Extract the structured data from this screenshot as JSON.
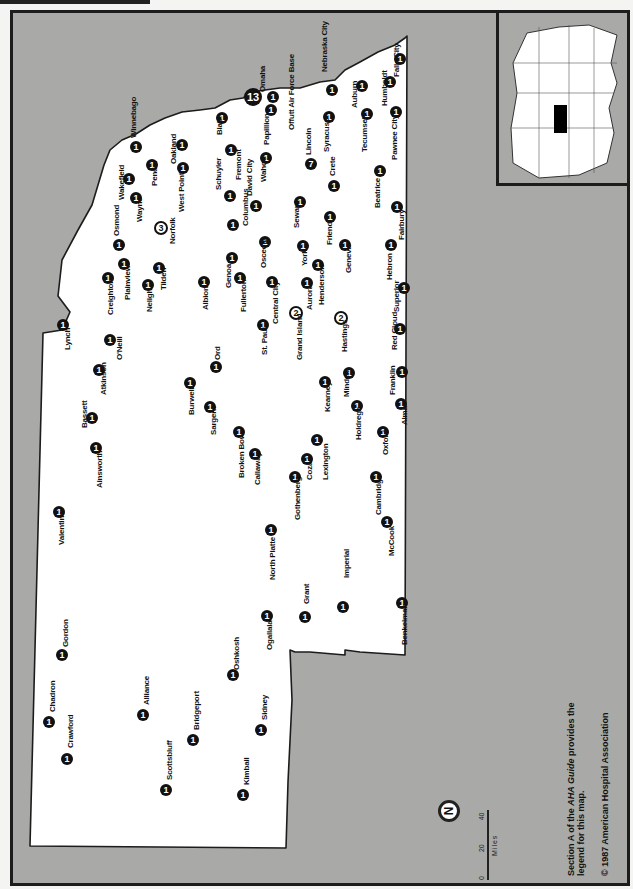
{
  "map": {
    "title": "Nebraska hospitals",
    "colors": {
      "background": "#a9a9a7",
      "state": "#ffffff",
      "marker": "#111111",
      "border": "#1c1c1c"
    },
    "scale": {
      "ticks": [
        "0",
        "20",
        "40"
      ],
      "unit": "Miles"
    },
    "compass": {
      "label": "N"
    },
    "note_line1_pre": "Section A of the ",
    "note_line1_em": "AHA Guide",
    "note_line1_post": " provides the",
    "note_line2": "legend for this map.",
    "copyright": "© 1987 American Hospital Association",
    "inset": {
      "label": "US locator map",
      "highlighted": "Nebraska"
    },
    "cities": [
      {
        "name": "Omaha",
        "count": "13",
        "x": 253,
        "y": 97,
        "lx": 263,
        "ly": 92,
        "big": true
      },
      {
        "name": "Offutt Air Force Base",
        "count": "1",
        "x": 273,
        "y": 97,
        "lx": 292,
        "ly": 130
      },
      {
        "name": "Papillion",
        "count": "1",
        "x": 271,
        "y": 110,
        "lx": 267,
        "ly": 145
      },
      {
        "name": "Nebraska City",
        "count": "1",
        "x": 332,
        "y": 90,
        "lx": 325,
        "ly": 72
      },
      {
        "name": "Falls City",
        "count": "1",
        "x": 400,
        "y": 59,
        "lx": 397,
        "ly": 77
      },
      {
        "name": "Humboldt",
        "count": "1",
        "x": 390,
        "y": 82,
        "lx": 385,
        "ly": 106
      },
      {
        "name": "Auburn",
        "count": "1",
        "x": 362,
        "y": 86,
        "lx": 355,
        "ly": 108
      },
      {
        "name": "Pawnee City",
        "count": "1",
        "x": 396,
        "y": 112,
        "lx": 395,
        "ly": 160
      },
      {
        "name": "Tecumseh",
        "count": "1",
        "x": 367,
        "y": 114,
        "lx": 365,
        "ly": 152
      },
      {
        "name": "Syracuse",
        "count": "1",
        "x": 329,
        "y": 117,
        "lx": 327,
        "ly": 152
      },
      {
        "name": "Lincoln",
        "count": "7",
        "x": 311,
        "y": 164,
        "lx": 309,
        "ly": 155,
        "outline": false
      },
      {
        "name": "Crete",
        "count": "1",
        "x": 334,
        "y": 186,
        "lx": 333,
        "ly": 176
      },
      {
        "name": "Beatrice",
        "count": "1",
        "x": 380,
        "y": 171,
        "lx": 378,
        "ly": 208
      },
      {
        "name": "Fairbury",
        "count": "1",
        "x": 397,
        "y": 207,
        "lx": 402,
        "ly": 240
      },
      {
        "name": "Wahoo",
        "count": "1",
        "x": 266,
        "y": 158,
        "lx": 264,
        "ly": 182
      },
      {
        "name": "Fremont",
        "count": "1",
        "x": 231,
        "y": 150,
        "lx": 239,
        "ly": 180
      },
      {
        "name": "Blair",
        "count": "1",
        "x": 222,
        "y": 118,
        "lx": 220,
        "ly": 135
      },
      {
        "name": "David City",
        "count": "1",
        "x": 256,
        "y": 206,
        "lx": 250,
        "ly": 196
      },
      {
        "name": "Schuyler",
        "count": "1",
        "x": 230,
        "y": 196,
        "lx": 219,
        "ly": 190
      },
      {
        "name": "Columbus",
        "count": "1",
        "x": 233,
        "y": 225,
        "lx": 246,
        "ly": 226
      },
      {
        "name": "Seward",
        "count": "1",
        "x": 300,
        "y": 202,
        "lx": 297,
        "ly": 228
      },
      {
        "name": "Friend",
        "count": "1",
        "x": 330,
        "y": 217,
        "lx": 330,
        "ly": 245
      },
      {
        "name": "Oakland",
        "count": "1",
        "x": 182,
        "y": 145,
        "lx": 174,
        "ly": 164
      },
      {
        "name": "West Point",
        "count": "1",
        "x": 183,
        "y": 168,
        "lx": 182,
        "ly": 212
      },
      {
        "name": "Pender",
        "count": "1",
        "x": 152,
        "y": 165,
        "lx": 155,
        "ly": 186
      },
      {
        "name": "Winnebago",
        "count": "1",
        "x": 136,
        "y": 147,
        "lx": 134,
        "ly": 138
      },
      {
        "name": "Wakefield",
        "count": "1",
        "x": 129,
        "y": 179,
        "lx": 122,
        "ly": 200
      },
      {
        "name": "Wayne",
        "count": "1",
        "x": 136,
        "y": 198,
        "lx": 140,
        "ly": 222
      },
      {
        "name": "Osmond",
        "count": "1",
        "x": 119,
        "y": 245,
        "lx": 117,
        "ly": 236
      },
      {
        "name": "Norfolk",
        "count": "3",
        "x": 161,
        "y": 228,
        "lx": 173,
        "ly": 244,
        "outline": true
      },
      {
        "name": "Tilden",
        "count": "1",
        "x": 159,
        "y": 268,
        "lx": 164,
        "ly": 290
      },
      {
        "name": "Plainview",
        "count": "1",
        "x": 124,
        "y": 264,
        "lx": 128,
        "ly": 300
      },
      {
        "name": "Creighton",
        "count": "1",
        "x": 108,
        "y": 278,
        "lx": 111,
        "ly": 315
      },
      {
        "name": "Neligh",
        "count": "1",
        "x": 148,
        "y": 285,
        "lx": 150,
        "ly": 312
      },
      {
        "name": "Lynch",
        "count": "1",
        "x": 63,
        "y": 325,
        "lx": 68,
        "ly": 350
      },
      {
        "name": "O'Neill",
        "count": "1",
        "x": 110,
        "y": 340,
        "lx": 120,
        "ly": 360
      },
      {
        "name": "Atkinson",
        "count": "1",
        "x": 99,
        "y": 370,
        "lx": 104,
        "ly": 395
      },
      {
        "name": "Bassett",
        "count": "1",
        "x": 92,
        "y": 418,
        "lx": 85,
        "ly": 428
      },
      {
        "name": "Ainsworth",
        "count": "1",
        "x": 96,
        "y": 448,
        "lx": 100,
        "ly": 488
      },
      {
        "name": "Valentine",
        "count": "1",
        "x": 59,
        "y": 512,
        "lx": 62,
        "ly": 545
      },
      {
        "name": "Albion",
        "count": "1",
        "x": 204,
        "y": 282,
        "lx": 206,
        "ly": 310
      },
      {
        "name": "Genoa",
        "count": "1",
        "x": 232,
        "y": 258,
        "lx": 229,
        "ly": 288
      },
      {
        "name": "Fullerton",
        "count": "1",
        "x": 240,
        "y": 278,
        "lx": 244,
        "ly": 312
      },
      {
        "name": "Osceola",
        "count": "1",
        "x": 265,
        "y": 242,
        "lx": 264,
        "ly": 268
      },
      {
        "name": "Central City",
        "count": "1",
        "x": 272,
        "y": 282,
        "lx": 276,
        "ly": 324
      },
      {
        "name": "York",
        "count": "1",
        "x": 303,
        "y": 246,
        "lx": 305,
        "ly": 266
      },
      {
        "name": "Henderson",
        "count": "1",
        "x": 318,
        "y": 265,
        "lx": 322,
        "ly": 305
      },
      {
        "name": "Aurora",
        "count": "1",
        "x": 307,
        "y": 283,
        "lx": 310,
        "ly": 310
      },
      {
        "name": "Geneva",
        "count": "1",
        "x": 345,
        "y": 245,
        "lx": 349,
        "ly": 273
      },
      {
        "name": "Hebron",
        "count": "1",
        "x": 391,
        "y": 245,
        "lx": 390,
        "ly": 280
      },
      {
        "name": "Superior",
        "count": "1",
        "x": 404,
        "y": 288,
        "lx": 397,
        "ly": 312
      },
      {
        "name": "Red Cloud",
        "count": "1",
        "x": 400,
        "y": 329,
        "lx": 395,
        "ly": 350
      },
      {
        "name": "Grand Island",
        "count": "2",
        "x": 296,
        "y": 313,
        "lx": 300,
        "ly": 360,
        "outline": true
      },
      {
        "name": "Hastings",
        "count": "2",
        "x": 341,
        "y": 318,
        "lx": 345,
        "ly": 352,
        "outline": true
      },
      {
        "name": "St. Paul",
        "count": "1",
        "x": 263,
        "y": 325,
        "lx": 265,
        "ly": 355
      },
      {
        "name": "Ord",
        "count": "1",
        "x": 216,
        "y": 367,
        "lx": 218,
        "ly": 360
      },
      {
        "name": "Burwell",
        "count": "1",
        "x": 190,
        "y": 383,
        "lx": 192,
        "ly": 415
      },
      {
        "name": "Sargent",
        "count": "1",
        "x": 210,
        "y": 407,
        "lx": 214,
        "ly": 435
      },
      {
        "name": "Broken Bow",
        "count": "1",
        "x": 239,
        "y": 432,
        "lx": 242,
        "ly": 478
      },
      {
        "name": "Callaway",
        "count": "1",
        "x": 255,
        "y": 454,
        "lx": 258,
        "ly": 485
      },
      {
        "name": "Kearney",
        "count": "1",
        "x": 325,
        "y": 382,
        "lx": 328,
        "ly": 412
      },
      {
        "name": "Minden",
        "count": "1",
        "x": 349,
        "y": 373,
        "lx": 347,
        "ly": 397
      },
      {
        "name": "Franklin",
        "count": "1",
        "x": 402,
        "y": 372,
        "lx": 393,
        "ly": 395
      },
      {
        "name": "Holdrege",
        "count": "1",
        "x": 357,
        "y": 406,
        "lx": 359,
        "ly": 440
      },
      {
        "name": "Alma",
        "count": "1",
        "x": 401,
        "y": 404,
        "lx": 405,
        "ly": 425
      },
      {
        "name": "Lexington",
        "count": "1",
        "x": 317,
        "y": 440,
        "lx": 326,
        "ly": 480
      },
      {
        "name": "Cozad",
        "count": "1",
        "x": 307,
        "y": 459,
        "lx": 310,
        "ly": 480
      },
      {
        "name": "Gothenberg",
        "count": "1",
        "x": 295,
        "y": 477,
        "lx": 298,
        "ly": 520
      },
      {
        "name": "Oxford",
        "count": "1",
        "x": 383,
        "y": 432,
        "lx": 386,
        "ly": 455
      },
      {
        "name": "Cambridge",
        "count": "1",
        "x": 376,
        "y": 477,
        "lx": 379,
        "ly": 515
      },
      {
        "name": "McCook",
        "count": "1",
        "x": 387,
        "y": 522,
        "lx": 392,
        "ly": 556
      },
      {
        "name": "North Platte",
        "count": "1",
        "x": 271,
        "y": 530,
        "lx": 273,
        "ly": 580
      },
      {
        "name": "Imperial",
        "count": "1",
        "x": 343,
        "y": 607,
        "lx": 347,
        "ly": 578
      },
      {
        "name": "Grant",
        "count": "1",
        "x": 305,
        "y": 617,
        "lx": 307,
        "ly": 604
      },
      {
        "name": "Benkelman",
        "count": "1",
        "x": 402,
        "y": 603,
        "lx": 405,
        "ly": 645
      },
      {
        "name": "Ogallala",
        "count": "1",
        "x": 267,
        "y": 616,
        "lx": 270,
        "ly": 650
      },
      {
        "name": "Oshkosh",
        "count": "1",
        "x": 233,
        "y": 675,
        "lx": 237,
        "ly": 670
      },
      {
        "name": "Gordon",
        "count": "1",
        "x": 62,
        "y": 655,
        "lx": 66,
        "ly": 647
      },
      {
        "name": "Chadron",
        "count": "1",
        "x": 49,
        "y": 722,
        "lx": 53,
        "ly": 712
      },
      {
        "name": "Crawford",
        "count": "1",
        "x": 67,
        "y": 759,
        "lx": 71,
        "ly": 748
      },
      {
        "name": "Alliance",
        "count": "1",
        "x": 143,
        "y": 715,
        "lx": 147,
        "ly": 705
      },
      {
        "name": "Bridgeport",
        "count": "1",
        "x": 193,
        "y": 740,
        "lx": 197,
        "ly": 730
      },
      {
        "name": "Sidney",
        "count": "1",
        "x": 261,
        "y": 730,
        "lx": 265,
        "ly": 720
      },
      {
        "name": "Scottsbluff",
        "count": "1",
        "x": 166,
        "y": 790,
        "lx": 170,
        "ly": 780
      },
      {
        "name": "Kimball",
        "count": "1",
        "x": 243,
        "y": 795,
        "lx": 247,
        "ly": 785
      }
    ]
  }
}
